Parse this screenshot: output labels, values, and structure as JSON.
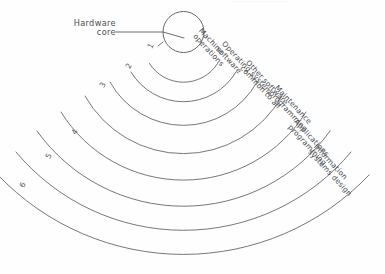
{
  "figure": {
    "core": {
      "label": "Hardware\ncore",
      "name": "hardware-core"
    },
    "rings": [
      {
        "number": "1",
        "label": "Machine\noperations",
        "num_x": 149,
        "num_y": 42,
        "num_rot": -62,
        "lbl_x": 203,
        "lbl_y": 27,
        "lbl_rot": 47
      },
      {
        "number": "2",
        "label": "Operating system\nsoftware",
        "num_x": 127,
        "num_y": 62,
        "num_rot": -62,
        "lbl_x": 226,
        "lbl_y": 40,
        "lbl_rot": 47
      },
      {
        "number": "3",
        "label": "Other software\ncommon to all",
        "num_x": 101,
        "num_y": 81,
        "num_rot": -62,
        "lbl_x": 250,
        "lbl_y": 59,
        "lbl_rot": 47
      },
      {
        "number": "4",
        "label": "Maintenance\nprogramming",
        "num_x": 73,
        "num_y": 128,
        "num_rot": -62,
        "lbl_x": 279,
        "lbl_y": 84,
        "lbl_rot": 47
      },
      {
        "number": "5",
        "label": "Applications\nprogramming",
        "num_x": 47,
        "num_y": 152,
        "num_rot": -62,
        "lbl_x": 298,
        "lbl_y": 118,
        "lbl_rot": 47
      },
      {
        "number": "6",
        "label": "Information\nsystems design",
        "num_x": 21,
        "num_y": 181,
        "num_rot": -62,
        "lbl_x": 318,
        "lbl_y": 143,
        "lbl_rot": 47
      }
    ],
    "top_bleed_text": "................................."
  }
}
